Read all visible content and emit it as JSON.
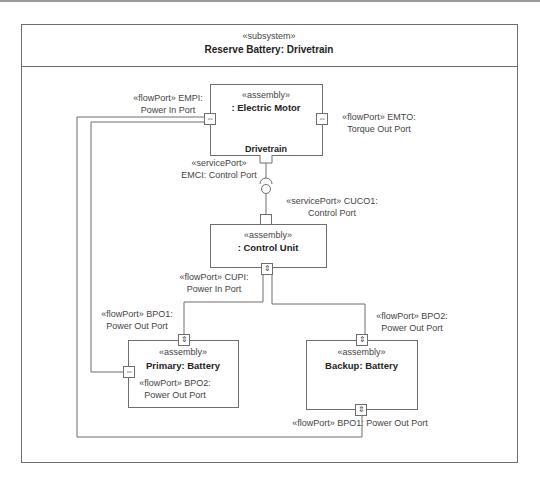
{
  "frame": {
    "stereotype": "«subsystem»",
    "title": "Reserve Battery: Drivetrain"
  },
  "blocks": {
    "electric_motor": {
      "stereotype": "«assembly»",
      "name": ": Electric Motor",
      "compartment": "Drivetrain"
    },
    "control_unit": {
      "stereotype": "«assembly»",
      "name": ": Control Unit"
    },
    "primary_battery": {
      "stereotype": "«assembly»",
      "name": "Primary: Battery"
    },
    "backup_battery": {
      "stereotype": "«assembly»",
      "name": "Backup: Battery"
    }
  },
  "ports": {
    "empi": {
      "line1": "«flowPort» EMPI:",
      "line2": "Power In Port",
      "glyph": "⇔"
    },
    "emto": {
      "line1": "«flowPort» EMTO:",
      "line2": "Torque Out Port",
      "glyph": "⇔"
    },
    "emci": {
      "line1": "«servicePort»",
      "line2": "EMCI: Control Port"
    },
    "cuco1": {
      "line1": "«servicePort» CUCO1:",
      "line2": "Control Port"
    },
    "cupi": {
      "line1": "«flowPort» CUPI:",
      "line2": "Power In Port",
      "glyph": "⇕"
    },
    "primary_bpo1": {
      "line1": "«flowPort» BPO1:",
      "line2": "Power Out Port",
      "glyph": "⇕"
    },
    "primary_bpo2": {
      "line1": "«flowPort» BPO2:",
      "line2": "Power Out Port",
      "glyph": "⇔"
    },
    "backup_bpo2": {
      "line1": "«flowPort» BPO2:",
      "line2": "Power Out Port",
      "glyph": "⇕"
    },
    "backup_bpo1": {
      "line1": "«flowPort» BPO1: Power Out Port",
      "glyph": "⇕"
    }
  },
  "colors": {
    "line": "#6e6e6e",
    "text": "#444444",
    "background": "#ffffff"
  }
}
